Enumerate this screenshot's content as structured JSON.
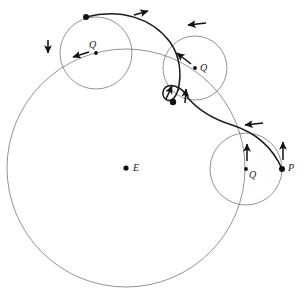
{
  "figure": {
    "type": "epicycle-diagram",
    "background_color": "#ffffff",
    "stroke_color_thin": "#777777",
    "stroke_color_heavy": "#1a1a1a",
    "marker_color": "#111111"
  },
  "labels": {
    "center": "E",
    "epicycle_center_1": "Q",
    "epicycle_center_2": "Q",
    "epicycle_center_3": "Q",
    "planet": "P"
  },
  "deferent": {
    "name": "deferent-circle",
    "cx": 126,
    "cy": 168,
    "r": 119
  },
  "epicycles": [
    {
      "name": "epicycle-upper-left",
      "cx": 96,
      "cy": 53,
      "r": 36
    },
    {
      "name": "epicycle-upper-right",
      "cx": 195,
      "cy": 68,
      "r": 32
    },
    {
      "name": "epicycle-lower-right",
      "cx": 246,
      "cy": 169,
      "r": 36
    }
  ],
  "markers": [
    {
      "name": "center-dot-E",
      "cx": 126,
      "cy": 168,
      "r": 2.6
    },
    {
      "name": "epicycle-center-dot-1",
      "cx": 96,
      "cy": 53,
      "r": 1.9
    },
    {
      "name": "epicycle-center-dot-2",
      "cx": 195,
      "cy": 68,
      "r": 1.9
    },
    {
      "name": "epicycle-center-dot-3",
      "cx": 246,
      "cy": 169,
      "r": 1.9
    },
    {
      "name": "planet-dot-start",
      "cx": 86,
      "cy": 17,
      "r": 3.0
    },
    {
      "name": "planet-dot-loop",
      "cx": 173,
      "cy": 102,
      "r": 3.2
    },
    {
      "name": "planet-dot-P",
      "cx": 282,
      "cy": 169,
      "r": 3.0
    }
  ],
  "label_positions": {
    "E": {
      "x": 133,
      "y": 163
    },
    "Q1": {
      "x": 89,
      "y": 40
    },
    "Q2": {
      "x": 200,
      "y": 64
    },
    "Q3": {
      "x": 249,
      "y": 170
    },
    "P": {
      "x": 288,
      "y": 163
    }
  },
  "arrows": [
    {
      "name": "arrow-path-top",
      "x": 141,
      "y": 13,
      "angle": -14
    },
    {
      "name": "arrow-epicycle1-left",
      "x": 48,
      "y": 46,
      "angle": 100
    },
    {
      "name": "arrow-epicycle1-center",
      "x": 80,
      "y": 55,
      "angle": 196
    },
    {
      "name": "arrow-epicycle2-top",
      "x": 196,
      "y": 24,
      "angle": 188
    },
    {
      "name": "arrow-epicycle2-center",
      "x": 183,
      "y": 58,
      "angle": 212
    },
    {
      "name": "arrow-loop-left",
      "x": 170,
      "y": 92,
      "angle": -70
    },
    {
      "name": "arrow-loop-right",
      "x": 186,
      "y": 96,
      "angle": -95
    },
    {
      "name": "arrow-epicycle3-top",
      "x": 254,
      "y": 124,
      "angle": 186
    },
    {
      "name": "arrow-epicycle3-center",
      "x": 247,
      "y": 152,
      "angle": -90
    },
    {
      "name": "arrow-planet-P",
      "x": 283,
      "y": 150,
      "angle": -86
    }
  ],
  "trajectory": {
    "name": "planet-apparent-path",
    "description": "Heavy curve from upper-left through the retrograde loop to lower right"
  }
}
